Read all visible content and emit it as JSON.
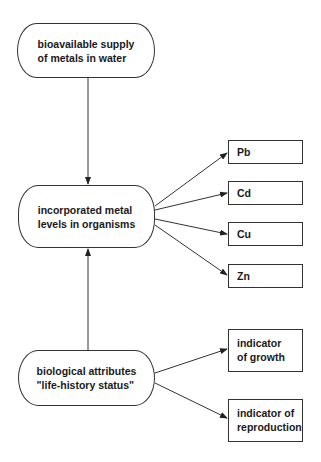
{
  "diagram": {
    "nodes": {
      "supply": {
        "line1": "bioavailable supply",
        "line2": "of metals in water"
      },
      "incorporated": {
        "line1": "incorporated metal",
        "line2": "levels in organisms"
      },
      "biological": {
        "line1": "biological attributes",
        "line2": "\"life-history status\""
      },
      "pb": {
        "label": "Pb"
      },
      "cd": {
        "label": "Cd"
      },
      "cu": {
        "label": "Cu"
      },
      "zn": {
        "label": "Zn"
      },
      "growth": {
        "line1": "indicator",
        "line2": "of growth"
      },
      "reproduction": {
        "line1": "indicator of",
        "line2": "reproduction"
      }
    },
    "edges": [
      {
        "from": "supply",
        "to": "incorporated"
      },
      {
        "from": "biological",
        "to": "incorporated"
      },
      {
        "from": "incorporated",
        "to": "pb"
      },
      {
        "from": "incorporated",
        "to": "cd"
      },
      {
        "from": "incorporated",
        "to": "cu"
      },
      {
        "from": "incorporated",
        "to": "zn"
      },
      {
        "from": "biological",
        "to": "growth"
      },
      {
        "from": "biological",
        "to": "reproduction"
      }
    ]
  }
}
